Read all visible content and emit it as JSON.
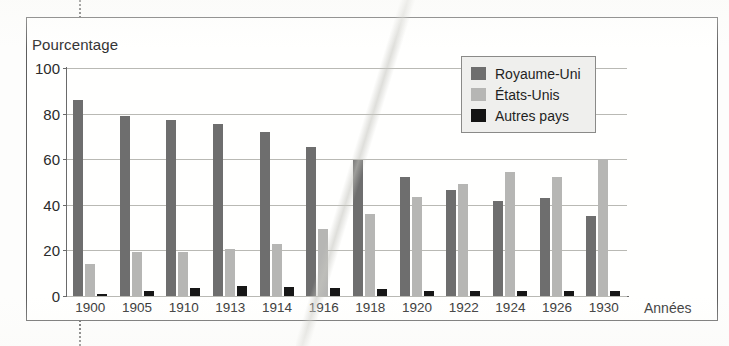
{
  "figure": {
    "frame_visible": true
  },
  "legend": {
    "position": "top-right",
    "entries": [
      {
        "label": "Royaume-Uni",
        "color": "#6e6e6e"
      },
      {
        "label": "États-Unis",
        "color": "#b6b6b4"
      },
      {
        "label": "Autres pays",
        "color": "#141414"
      }
    ]
  },
  "axes": {
    "ylabel": "Pourcentage",
    "xlabel": "Années",
    "yticks": [
      "100",
      "80",
      "60",
      "40",
      "20",
      "0"
    ]
  },
  "chart_data": {
    "type": "bar",
    "title": "",
    "subtitle": "",
    "xlabel": "Années",
    "ylabel": "Pourcentage",
    "ylim": [
      0,
      100
    ],
    "ytick_values": [
      0,
      20,
      40,
      60,
      80,
      100
    ],
    "grid": true,
    "legend_position": "top-right",
    "categories": [
      "1900",
      "1905",
      "1910",
      "1913",
      "1914",
      "1916",
      "1918",
      "1920",
      "1922",
      "1924",
      "1926",
      "1930"
    ],
    "series": [
      {
        "name": "Royaume-Uni",
        "color": "#6e6e6e",
        "values": [
          86,
          79,
          77,
          75.5,
          72,
          65.5,
          59.5,
          52,
          46.5,
          41.5,
          43,
          35
        ]
      },
      {
        "name": "États-Unis",
        "color": "#b6b6b4",
        "values": [
          14,
          19.5,
          19.5,
          20.5,
          23,
          29.5,
          36,
          43.5,
          49,
          54.5,
          52,
          60
        ]
      },
      {
        "name": "Autres pays",
        "color": "#141414",
        "values": [
          1,
          2,
          3.5,
          4.5,
          4,
          3.5,
          3,
          2,
          2,
          2,
          2,
          2
        ]
      }
    ]
  }
}
